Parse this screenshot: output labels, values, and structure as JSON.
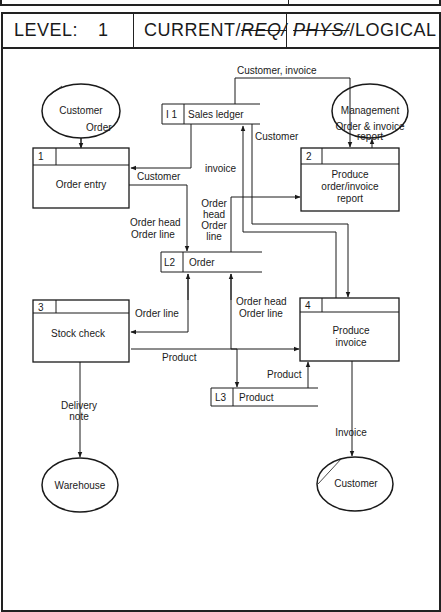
{
  "header": {
    "level_label": "LEVEL:",
    "level_value": "1",
    "status_current": "CURRENT/",
    "status_req": "REQ/",
    "status_phys": "PHYS/",
    "status_logical": "/LOGICAL"
  },
  "externals": {
    "customer_top": "Customer",
    "management": "Management",
    "warehouse": "Warehouse",
    "customer_bottom": "Customer"
  },
  "processes": [
    {
      "id": "1",
      "name": "Order entry"
    },
    {
      "id": "2",
      "name_lines": [
        "Produce",
        "order/invoice",
        "report"
      ]
    },
    {
      "id": "3",
      "name": "Stock check"
    },
    {
      "id": "4",
      "name_lines": [
        "Produce",
        "invoice"
      ]
    }
  ],
  "stores": [
    {
      "id": "I 1",
      "name": "Sales ledger"
    },
    {
      "id": "L2",
      "name": "Order"
    },
    {
      "id": "L3",
      "name": "Product"
    }
  ],
  "flows": {
    "order": "Order",
    "customer_invoice": "Customer, invoice",
    "customer_1": "Customer",
    "customer_2": "Customer",
    "invoice_up": "invoice",
    "order_invoice_report_1": "Order & invoice",
    "order_invoice_report_2": "report",
    "order_head_1a": "Order head",
    "order_line_1b": "Order line",
    "order_head_2a": "Order",
    "order_head_2b": "head",
    "order_head_2c": "Order",
    "order_head_2d": "line",
    "order_line_3": "Order line",
    "order_head_4a": "Order head",
    "order_line_4b": "Order line",
    "product_3": "Product",
    "product_4": "Product",
    "delivery_1": "Delivery",
    "delivery_2": "note",
    "invoice_out": "Invoice"
  }
}
